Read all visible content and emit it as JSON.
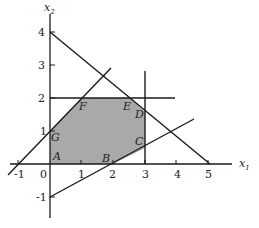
{
  "figure": {
    "type": "feasible-region-diagram",
    "axes": {
      "x_label": "x",
      "x_sub": "1",
      "y_label": "x",
      "y_sub": "2",
      "x_ticks": [
        "-1",
        "0",
        "1",
        "2",
        "3",
        "4",
        "5"
      ],
      "y_ticks": [
        "4",
        "3",
        "2",
        "1",
        "-1"
      ]
    },
    "points": [
      {
        "name": "A",
        "label": "A"
      },
      {
        "name": "B",
        "label": "B"
      },
      {
        "name": "C",
        "label": "C"
      },
      {
        "name": "D",
        "label": "D"
      },
      {
        "name": "E",
        "label": "E"
      },
      {
        "name": "F",
        "label": "F"
      },
      {
        "name": "G",
        "label": "G"
      }
    ],
    "colors": {
      "region_fill": "#a9a9a9",
      "line": "#1a1a1a"
    },
    "constraints": [
      "x1 + x2 <= ... line from (0,4) to (5,0)",
      "line through (-1,0) and (0,1): x2 = x1 + 1",
      "line through (0,-1) and (2,0): x2 = x1/2 - 1",
      "x2 = 2",
      "x1 = 3"
    ]
  }
}
